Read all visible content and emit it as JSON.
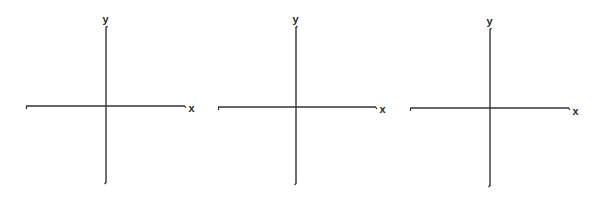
{
  "diagram": {
    "line_color": "#333333",
    "background": "#ffffff",
    "axes": [
      {
        "id": "axes-1",
        "x_label": "x",
        "y_label": "y",
        "origin": [
          106,
          106
        ],
        "x_range": [
          26,
          185
        ],
        "y_range": [
          27,
          183
        ]
      },
      {
        "id": "axes-2",
        "x_label": "x",
        "y_label": "y",
        "origin": [
          296,
          107
        ],
        "x_range": [
          218,
          376
        ],
        "y_range": [
          27,
          184
        ]
      },
      {
        "id": "axes-3",
        "x_label": "x",
        "y_label": "y",
        "origin": [
          490,
          108
        ],
        "x_range": [
          410,
          569
        ],
        "y_range": [
          29,
          186
        ]
      }
    ]
  }
}
